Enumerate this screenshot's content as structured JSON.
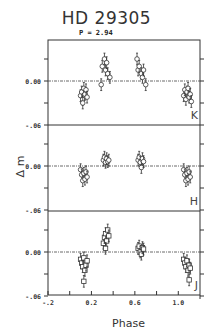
{
  "chart_data": {
    "type": "scatter",
    "title": "HD 29305",
    "subtitle": "P = 2.94",
    "xlabel": "Phase",
    "ylabel": "Δ m",
    "xlim": [
      -0.2,
      1.2
    ],
    "x_ticks": [
      -0.2,
      0.0,
      0.2,
      0.4,
      0.6,
      0.8,
      1.0
    ],
    "x_tick_labels": [
      "-.2",
      "0.2",
      "0.6",
      "1.0"
    ],
    "x_tick_label_values": [
      -0.2,
      0.2,
      0.6,
      1.0
    ],
    "y_tick_labels": [
      "0.00",
      "-.06"
    ],
    "ylim_per_panel": [
      -0.06,
      0.056
    ],
    "grid": false,
    "zero_line": "dash-dot",
    "panels": [
      {
        "band": "K",
        "marker": "circle",
        "points": [
          {
            "x": 0.1,
            "y": -0.02
          },
          {
            "x": 0.11,
            "y": -0.015
          },
          {
            "x": 0.12,
            "y": -0.025
          },
          {
            "x": 0.13,
            "y": -0.01
          },
          {
            "x": 0.14,
            "y": -0.018
          },
          {
            "x": 0.15,
            "y": -0.012
          },
          {
            "x": 0.16,
            "y": -0.022
          },
          {
            "x": 0.12,
            "y": -0.03
          },
          {
            "x": 0.3,
            "y": 0.02
          },
          {
            "x": 0.32,
            "y": 0.03
          },
          {
            "x": 0.33,
            "y": 0.015
          },
          {
            "x": 0.34,
            "y": 0.025
          },
          {
            "x": 0.35,
            "y": 0.01
          },
          {
            "x": 0.37,
            "y": 0.005
          },
          {
            "x": 0.29,
            "y": -0.005
          },
          {
            "x": 0.62,
            "y": 0.03
          },
          {
            "x": 0.63,
            "y": 0.015
          },
          {
            "x": 0.64,
            "y": 0.02
          },
          {
            "x": 0.66,
            "y": 0.01
          },
          {
            "x": 0.67,
            "y": 0.005
          },
          {
            "x": 0.68,
            "y": 0.015
          },
          {
            "x": 0.7,
            "y": -0.005
          },
          {
            "x": 1.05,
            "y": -0.02
          },
          {
            "x": 1.06,
            "y": -0.012
          },
          {
            "x": 1.07,
            "y": -0.025
          },
          {
            "x": 1.08,
            "y": -0.015
          },
          {
            "x": 1.09,
            "y": -0.01
          },
          {
            "x": 1.1,
            "y": -0.022
          },
          {
            "x": 1.11,
            "y": -0.018
          },
          {
            "x": 1.12,
            "y": -0.028
          }
        ],
        "error_bar": 0.008
      },
      {
        "band": "H",
        "marker": "circle",
        "points": [
          {
            "x": 0.1,
            "y": -0.005
          },
          {
            "x": 0.11,
            "y": -0.012
          },
          {
            "x": 0.12,
            "y": -0.02
          },
          {
            "x": 0.13,
            "y": -0.01
          },
          {
            "x": 0.14,
            "y": -0.018
          },
          {
            "x": 0.15,
            "y": -0.008
          },
          {
            "x": 0.16,
            "y": -0.015
          },
          {
            "x": 0.31,
            "y": 0.008
          },
          {
            "x": 0.32,
            "y": 0.012
          },
          {
            "x": 0.33,
            "y": 0.005
          },
          {
            "x": 0.34,
            "y": 0.01
          },
          {
            "x": 0.35,
            "y": 0.006
          },
          {
            "x": 0.36,
            "y": 0.008
          },
          {
            "x": 0.63,
            "y": 0.008
          },
          {
            "x": 0.64,
            "y": 0.012
          },
          {
            "x": 0.65,
            "y": 0.005
          },
          {
            "x": 0.66,
            "y": -0.002
          },
          {
            "x": 0.67,
            "y": 0.01
          },
          {
            "x": 0.68,
            "y": 0.006
          },
          {
            "x": 1.05,
            "y": -0.005
          },
          {
            "x": 1.06,
            "y": -0.012
          },
          {
            "x": 1.07,
            "y": -0.02
          },
          {
            "x": 1.08,
            "y": -0.01
          },
          {
            "x": 1.09,
            "y": -0.018
          },
          {
            "x": 1.1,
            "y": -0.008
          },
          {
            "x": 1.11,
            "y": -0.015
          }
        ],
        "error_bar": 0.008
      },
      {
        "band": "J",
        "marker": "square",
        "points": [
          {
            "x": 0.1,
            "y": -0.01
          },
          {
            "x": 0.11,
            "y": -0.015
          },
          {
            "x": 0.12,
            "y": -0.02
          },
          {
            "x": 0.13,
            "y": -0.008
          },
          {
            "x": 0.14,
            "y": -0.025
          },
          {
            "x": 0.15,
            "y": -0.018
          },
          {
            "x": 0.16,
            "y": -0.012
          },
          {
            "x": 0.13,
            "y": -0.04
          },
          {
            "x": 0.31,
            "y": 0.012
          },
          {
            "x": 0.32,
            "y": 0.02
          },
          {
            "x": 0.33,
            "y": 0.025
          },
          {
            "x": 0.34,
            "y": 0.015
          },
          {
            "x": 0.35,
            "y": 0.03
          },
          {
            "x": 0.36,
            "y": 0.022
          },
          {
            "x": 0.33,
            "y": 0.005
          },
          {
            "x": 0.63,
            "y": 0.005
          },
          {
            "x": 0.64,
            "y": 0.008
          },
          {
            "x": 0.65,
            "y": 0.0
          },
          {
            "x": 0.66,
            "y": -0.003
          },
          {
            "x": 0.67,
            "y": 0.006
          },
          {
            "x": 0.68,
            "y": 0.004
          },
          {
            "x": 1.05,
            "y": -0.01
          },
          {
            "x": 1.06,
            "y": -0.015
          },
          {
            "x": 1.07,
            "y": -0.02
          },
          {
            "x": 1.08,
            "y": -0.012
          },
          {
            "x": 1.09,
            "y": -0.025
          },
          {
            "x": 1.1,
            "y": -0.018
          },
          {
            "x": 1.11,
            "y": -0.022
          },
          {
            "x": 1.1,
            "y": -0.038
          }
        ],
        "error_bar": 0.008
      }
    ]
  },
  "header": {
    "title": "HD 29305",
    "period_label": "P =  2.94"
  },
  "axes": {
    "xlabel": "Phase",
    "ylabel": "Δ m"
  }
}
